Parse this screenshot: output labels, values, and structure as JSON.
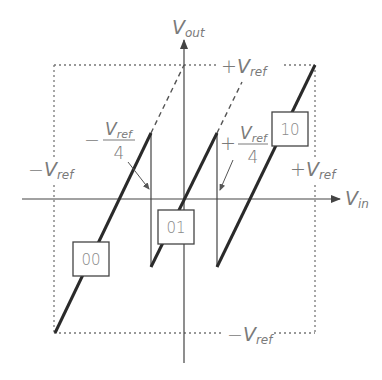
{
  "diagram": {
    "type": "transfer-characteristic",
    "axes": {
      "y_label_main": "V",
      "y_label_sub": "out",
      "x_label_main": "V",
      "x_label_sub": "in"
    },
    "bounds": {
      "top": {
        "sign": "+",
        "main": "V",
        "sub": "ref"
      },
      "bottom": {
        "sign": "−",
        "main": "V",
        "sub": "ref"
      },
      "left": {
        "sign": "−",
        "main": "V",
        "sub": "ref"
      },
      "right": {
        "sign": "+",
        "main": "V",
        "sub": "ref"
      }
    },
    "thresholds": {
      "negative": {
        "sign": "−",
        "num_main": "V",
        "num_sub": "ref",
        "den": "4"
      },
      "positive": {
        "sign": "+",
        "num_main": "V",
        "num_sub": "ref",
        "den": "4"
      }
    },
    "codes": [
      "00",
      "01",
      "10"
    ],
    "colors": {
      "line": "#2a2a2a",
      "axis": "#555555",
      "dashed": "#777777",
      "label": "#7a7a7a",
      "background": "#ffffff"
    }
  }
}
